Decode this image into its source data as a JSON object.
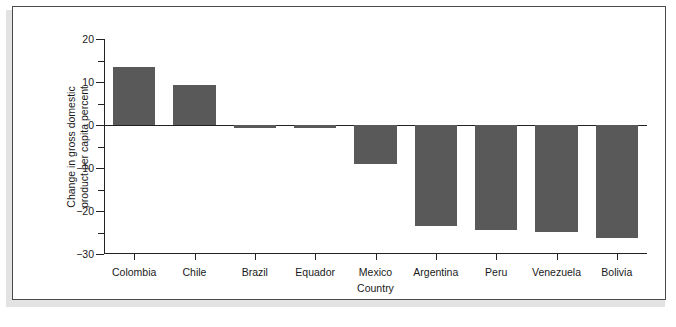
{
  "chart_data": {
    "type": "bar",
    "title": "",
    "xlabel": "Country",
    "ylabel_lines": [
      "Change in gross domestic",
      "product per capita percent"
    ],
    "ylabel": "Change in gross domestic product per capita percent",
    "categories": [
      "Colombia",
      "Chile",
      "Brazil",
      "Equador",
      "Mexico",
      "Argentina",
      "Peru",
      "Venezuela",
      "Bolivia"
    ],
    "values": [
      13.5,
      9.3,
      -0.6,
      -0.7,
      -9.0,
      -23.5,
      -24.5,
      -24.8,
      -26.3
    ],
    "ylim": [
      -30,
      20
    ],
    "ytick_labels": [
      "20",
      "10",
      "0",
      "-10",
      "-20",
      "-30"
    ],
    "ytick_values": [
      20,
      10,
      0,
      -10,
      -20,
      -30
    ],
    "yminor_values": [
      15,
      5,
      -5,
      -15,
      -25
    ],
    "grid": false,
    "legend": "none",
    "bar_color": "#595959",
    "axis_color": "#222222",
    "background_color": "#ffffff"
  },
  "figure": {
    "border_color": "#4b4b4b",
    "shadow_color": "#e3e3e3"
  }
}
